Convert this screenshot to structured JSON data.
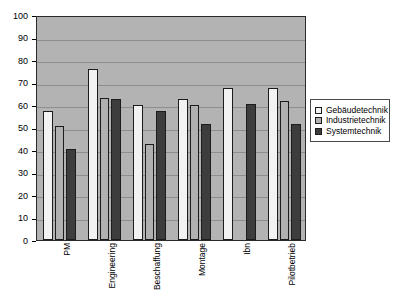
{
  "chart_data": {
    "type": "bar",
    "title": "",
    "subtitle": "",
    "xlabel": "",
    "ylabel": "",
    "ylim": [
      0,
      100
    ],
    "yticks": [
      0,
      10,
      20,
      30,
      40,
      50,
      60,
      70,
      80,
      90,
      100
    ],
    "ytick_labels": [
      "0",
      "10",
      "20",
      "30",
      "40",
      "50",
      "60",
      "70",
      "80",
      "90",
      "100"
    ],
    "grid": true,
    "grid_axis": "y",
    "legend_position": "right",
    "plot_background": "#b3b3b3",
    "categories": [
      "PM",
      "Engineering",
      "Beschaffung",
      "Montage",
      "Ibn",
      "Pilotbetrieb"
    ],
    "series": [
      {
        "name": "Gebäudetechnik",
        "color": "#f2f2f2",
        "values": [
          57.5,
          76,
          60,
          62.5,
          67.5,
          67.5
        ]
      },
      {
        "name": "Industrietechnik",
        "color": "#b0b0b0",
        "values": [
          50.5,
          63,
          42.5,
          60,
          0,
          62
        ]
      },
      {
        "name": "Systemtechnik",
        "color": "#3d3d3d",
        "values": [
          40.5,
          62.5,
          57.5,
          51.5,
          60.5,
          51.5
        ]
      }
    ]
  },
  "legend": {
    "items": [
      {
        "label": "Gebäudetechnik",
        "color": "#f2f2f2"
      },
      {
        "label": "Industrietechnik",
        "color": "#b0b0b0"
      },
      {
        "label": "Systemtechnik",
        "color": "#3d3d3d"
      }
    ]
  }
}
